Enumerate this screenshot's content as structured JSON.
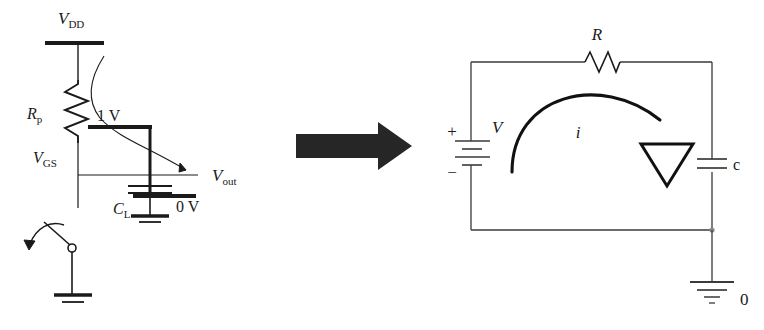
{
  "figure": {
    "title_visible": false,
    "background_color": "#ffffff",
    "stroke_color": "#1a1a1a",
    "type": "circuit-diagram-equivalence"
  },
  "left_circuit": {
    "name": "mos-inverter-with-load-capacitor",
    "labels": {
      "supply_rail": "V",
      "supply_rail_sub": "DD",
      "pullup_resistor": "R",
      "pullup_resistor_sub": "p",
      "gate_source_voltage": "V",
      "gate_source_voltage_sub": "GS",
      "gate_level": "1 V",
      "output": "V",
      "output_sub": "out",
      "load_capacitor": "C",
      "load_capacitor_sub": "L",
      "ground_level": "0 V"
    }
  },
  "transform_arrow": {
    "name": "equivalence-arrow",
    "direction": "right",
    "color": "#262626"
  },
  "right_circuit": {
    "name": "rc-equivalent-circuit",
    "labels": {
      "source": "V",
      "plus": "+",
      "minus": "−",
      "resistor": "R",
      "current": "i",
      "capacitor": "c",
      "ground": "0"
    }
  }
}
